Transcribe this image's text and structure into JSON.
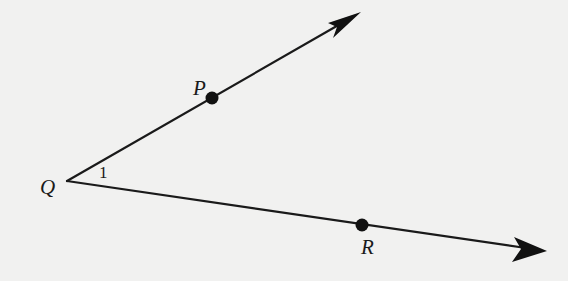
{
  "figure": {
    "type": "angle",
    "vertex": {
      "label": "Q",
      "x": 67,
      "y": 181
    },
    "angle_label": "1",
    "rays": [
      {
        "name": "ray-QP",
        "through_point": {
          "label": "P",
          "x": 212,
          "y": 98
        },
        "arrow_tip": {
          "x": 360,
          "y": 13
        }
      },
      {
        "name": "ray-QR",
        "through_point": {
          "label": "R",
          "x": 362,
          "y": 225
        },
        "arrow_tip": {
          "x": 546,
          "y": 251
        }
      }
    ],
    "colors": {
      "line": "#1a1a1a",
      "background": "#f1f1f0"
    }
  }
}
